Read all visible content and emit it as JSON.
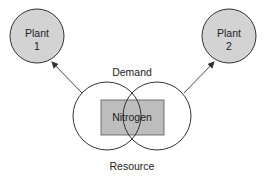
{
  "diagram": {
    "type": "venn-flow",
    "colors": {
      "plant_fill": "#d3d3d3",
      "rect_fill": "#bdbdbd",
      "stroke": "#333333",
      "background": "#ffffff"
    },
    "plants": [
      {
        "label_line1": "Plant",
        "label_line2": "1"
      },
      {
        "label_line1": "Plant",
        "label_line2": "2"
      }
    ],
    "venn": {
      "top_label": "Demand",
      "bottom_label": "Resource",
      "center_label": "Nitrogen"
    },
    "arrows": [
      {
        "from": "venn-left-circle",
        "to": "plant-1"
      },
      {
        "from": "venn-right-circle",
        "to": "plant-2"
      }
    ]
  }
}
